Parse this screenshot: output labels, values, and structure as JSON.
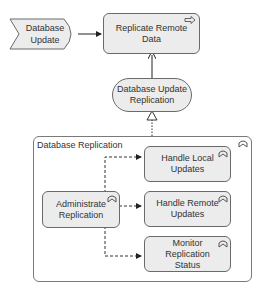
{
  "diagram": {
    "event": {
      "label_line1": "Database",
      "label_line2": "Update"
    },
    "process_replicate": {
      "label_line1": "Replicate Remote",
      "label_line2": "Data"
    },
    "service": {
      "label_line1": "Database Update",
      "label_line2": "Replication"
    },
    "group": {
      "label": "Database Replication"
    },
    "functions": [
      {
        "line1": "Handle Local",
        "line2": "Updates",
        "line3": ""
      },
      {
        "line1": "Handle Remote",
        "line2": "Updates",
        "line3": ""
      },
      {
        "line1": "Monitor",
        "line2": "Replication",
        "line3": "Status"
      }
    ],
    "admin": {
      "label_line1": "Administrate",
      "label_line2": "Replication"
    }
  },
  "colors": {
    "node_fill": "#ececec",
    "border": "#6a6a6a",
    "line": "#333333"
  }
}
